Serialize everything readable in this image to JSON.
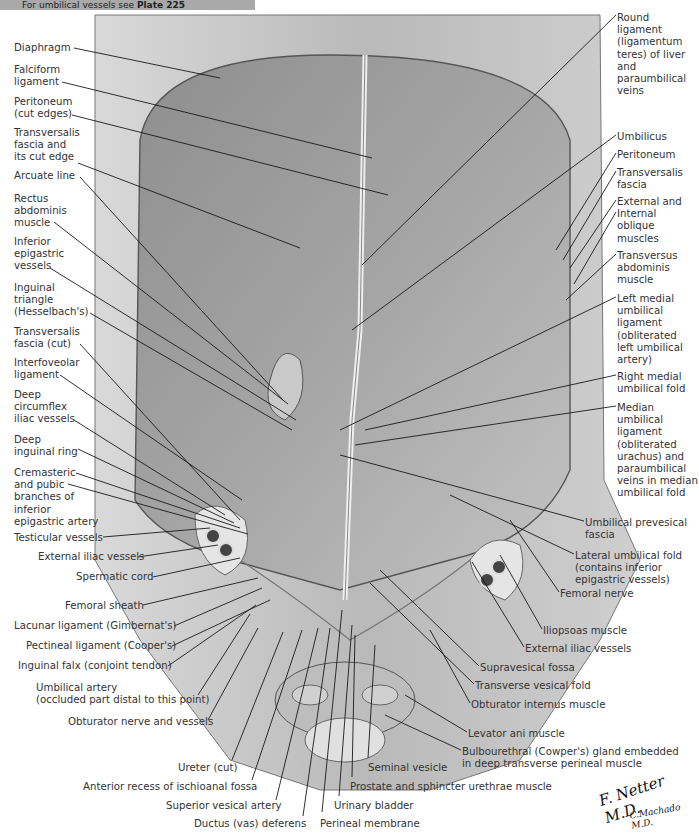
{
  "banner": {
    "prefix": "For umbilical vessels see ",
    "plate": "Plate 225"
  },
  "left_labels": [
    {
      "id": "diaphragm",
      "lines": [
        "Diaphragm"
      ],
      "x": 14,
      "y": 42
    },
    {
      "id": "falciform",
      "lines": [
        "Falciform",
        "ligament"
      ],
      "x": 14,
      "y": 64
    },
    {
      "id": "peritoneum-cut",
      "lines": [
        "Peritoneum",
        "(cut edges)"
      ],
      "x": 14,
      "y": 96
    },
    {
      "id": "transversalis-cut-edge",
      "lines": [
        "Transversalis",
        "fascia and",
        "its cut edge"
      ],
      "x": 14,
      "y": 127
    },
    {
      "id": "arcuate",
      "lines": [
        "Arcuate line"
      ],
      "x": 14,
      "y": 170
    },
    {
      "id": "rectus",
      "lines": [
        "Rectus",
        "abdominis",
        "muscle"
      ],
      "x": 14,
      "y": 193
    },
    {
      "id": "inf-epigastric",
      "lines": [
        "Inferior",
        "epigastric",
        "vessels"
      ],
      "x": 14,
      "y": 236
    },
    {
      "id": "inguinal-triangle",
      "lines": [
        "Inguinal",
        "triangle",
        "(Hesselbach's)"
      ],
      "x": 14,
      "y": 282
    },
    {
      "id": "transversalis-cut",
      "lines": [
        "Transversalis",
        "fascia (cut)"
      ],
      "x": 14,
      "y": 326
    },
    {
      "id": "interfoveolar",
      "lines": [
        "Interfoveolar",
        "ligament"
      ],
      "x": 14,
      "y": 357
    },
    {
      "id": "deep-circumflex",
      "lines": [
        "Deep",
        "circumflex",
        "iliac vessels"
      ],
      "x": 14,
      "y": 389
    },
    {
      "id": "deep-inguinal-ring",
      "lines": [
        "Deep",
        "inguinal ring"
      ],
      "x": 14,
      "y": 434
    },
    {
      "id": "cremasteric",
      "lines": [
        "Cremasteric",
        "and pubic",
        "branches of",
        "inferior",
        "epigastric artery"
      ],
      "x": 14,
      "y": 467
    },
    {
      "id": "testicular",
      "lines": [
        "Testicular vessels"
      ],
      "x": 14,
      "y": 532
    },
    {
      "id": "ext-iliac-left",
      "lines": [
        "External iliac vessels"
      ],
      "x": 38,
      "y": 551
    },
    {
      "id": "spermatic",
      "lines": [
        "Spermatic cord"
      ],
      "x": 76,
      "y": 571
    },
    {
      "id": "femoral-sheath",
      "lines": [
        "Femoral sheath"
      ],
      "x": 65,
      "y": 600
    },
    {
      "id": "lacunar",
      "lines": [
        "Lacunar ligament (Gimbernat's)"
      ],
      "x": 14,
      "y": 620
    },
    {
      "id": "pectineal",
      "lines": [
        "Pectineal ligament (Cooper's)"
      ],
      "x": 26,
      "y": 640
    },
    {
      "id": "inguinal-falx",
      "lines": [
        "Inguinal falx (conjoint tendon)"
      ],
      "x": 18,
      "y": 660
    },
    {
      "id": "umbilical-artery",
      "lines": [
        "Umbilical artery",
        "(occluded part distal to this point)"
      ],
      "x": 36,
      "y": 682
    },
    {
      "id": "obturator-nerve",
      "lines": [
        "Obturator nerve and vessels"
      ],
      "x": 68,
      "y": 716
    }
  ],
  "bottom_labels": [
    {
      "id": "ureter",
      "text": "Ureter (cut)",
      "x": 178,
      "y": 762
    },
    {
      "id": "ant-recess",
      "text": "Anterior recess of ischioanal fossa",
      "x": 83,
      "y": 781
    },
    {
      "id": "sup-vesical",
      "text": "Superior vesical artery",
      "x": 166,
      "y": 800
    },
    {
      "id": "ductus",
      "text": "Ductus (vas) deferens",
      "x": 194,
      "y": 818
    },
    {
      "id": "perineal-membrane",
      "text": "Perineal membrane",
      "x": 320,
      "y": 818
    },
    {
      "id": "urinary-bladder",
      "text": "Urinary bladder",
      "x": 334,
      "y": 800
    },
    {
      "id": "prostate",
      "text": "Prostate and sphincter urethrae muscle",
      "x": 350,
      "y": 781
    },
    {
      "id": "seminal-vesicle",
      "text": "Seminal vesicle",
      "x": 368,
      "y": 762
    }
  ],
  "right_labels": [
    {
      "id": "round-ligament",
      "lines": [
        "Round",
        "ligament",
        "(ligamentum",
        "teres) of liver",
        "and",
        "paraumbilical",
        "veins"
      ],
      "x": 617,
      "y": 12
    },
    {
      "id": "umbilicus",
      "lines": [
        "Umbilicus"
      ],
      "x": 617,
      "y": 131
    },
    {
      "id": "peritoneum",
      "lines": [
        "Peritoneum"
      ],
      "x": 617,
      "y": 149
    },
    {
      "id": "transversalis",
      "lines": [
        "Transversalis",
        "fascia"
      ],
      "x": 617,
      "y": 167
    },
    {
      "id": "ext-int-oblique",
      "lines": [
        "External and",
        "Internal",
        "oblique",
        "muscles"
      ],
      "x": 617,
      "y": 196
    },
    {
      "id": "transversus",
      "lines": [
        "Transversus",
        "abdominis",
        "muscle"
      ],
      "x": 617,
      "y": 250
    },
    {
      "id": "left-medial-umbilical",
      "lines": [
        "Left medial",
        "umbilical",
        "ligament",
        "(obliterated",
        "left umbilical",
        "artery)"
      ],
      "x": 617,
      "y": 293
    },
    {
      "id": "right-medial-fold",
      "lines": [
        "Right medial",
        "umbilical fold"
      ],
      "x": 617,
      "y": 371
    },
    {
      "id": "median-umbilical",
      "lines": [
        "Median",
        "umbilical",
        "ligament",
        "(obliterated",
        "urachus) and",
        "paraumbilical",
        "veins in median",
        "umbilical fold"
      ],
      "x": 617,
      "y": 402
    }
  ],
  "lower_right_labels": [
    {
      "id": "prevesical",
      "lines": [
        "Umbilical prevesical",
        "fascia"
      ],
      "x": 585,
      "y": 517
    },
    {
      "id": "lateral-umbilical-fold",
      "lines": [
        "Lateral umbilical fold",
        "(contains inferior",
        "epigastric vessels)"
      ],
      "x": 575,
      "y": 550
    },
    {
      "id": "femoral-nerve",
      "lines": [
        "Femoral nerve"
      ],
      "x": 560,
      "y": 588
    },
    {
      "id": "iliopsoas",
      "lines": [
        "Iliopsoas muscle"
      ],
      "x": 543,
      "y": 625
    },
    {
      "id": "ext-iliac-right",
      "lines": [
        "External iliac vessels"
      ],
      "x": 525,
      "y": 643
    },
    {
      "id": "supravesical",
      "lines": [
        "Supravesical fossa"
      ],
      "x": 480,
      "y": 662
    },
    {
      "id": "transverse-vesical",
      "lines": [
        "Transverse vesical fold"
      ],
      "x": 475,
      "y": 680
    },
    {
      "id": "obturator-internus",
      "lines": [
        "Obturator internus muscle"
      ],
      "x": 471,
      "y": 699
    },
    {
      "id": "levator-ani",
      "lines": [
        "Levator ani muscle"
      ],
      "x": 468,
      "y": 728
    },
    {
      "id": "bulbourethral",
      "lines": [
        "Bulbourethral (Cowper's) gland  embedded",
        "in deep transverse perineal muscle"
      ],
      "x": 462,
      "y": 746
    }
  ],
  "signature": {
    "artist": "F. Netter M.D.",
    "coartist": "C.Machado M.D."
  },
  "colors": {
    "banner": "#a9a9a9",
    "ink": "#333333",
    "leader": "#1a1a1a"
  }
}
